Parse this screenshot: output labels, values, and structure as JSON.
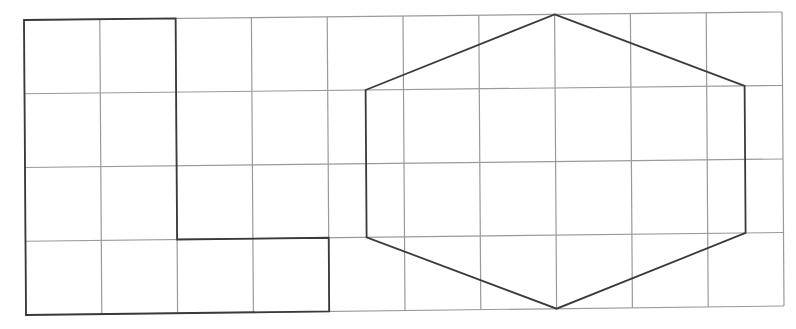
{
  "diagram": {
    "type": "grid-shapes",
    "grid": {
      "columns": 10,
      "rows": 4,
      "line_color": "#9a9a9a",
      "corners": {
        "top_left": [
          24,
          20
        ],
        "top_right": [
          782,
          12
        ],
        "bottom_left": [
          26,
          315
        ],
        "bottom_right": [
          784,
          306
        ]
      }
    },
    "shapes": [
      {
        "name": "l-shape",
        "stroke": "#3a3a3a",
        "grid_vertices": [
          [
            0,
            0
          ],
          [
            2,
            0
          ],
          [
            2,
            3
          ],
          [
            4,
            3
          ],
          [
            4,
            4
          ],
          [
            0,
            4
          ]
        ]
      },
      {
        "name": "hexagon",
        "stroke": "#3a3a3a",
        "grid_vertices": [
          [
            7,
            0
          ],
          [
            9.5,
            1
          ],
          [
            9.5,
            3
          ],
          [
            7,
            4
          ],
          [
            4.5,
            3
          ],
          [
            4.5,
            1
          ]
        ]
      }
    ]
  }
}
